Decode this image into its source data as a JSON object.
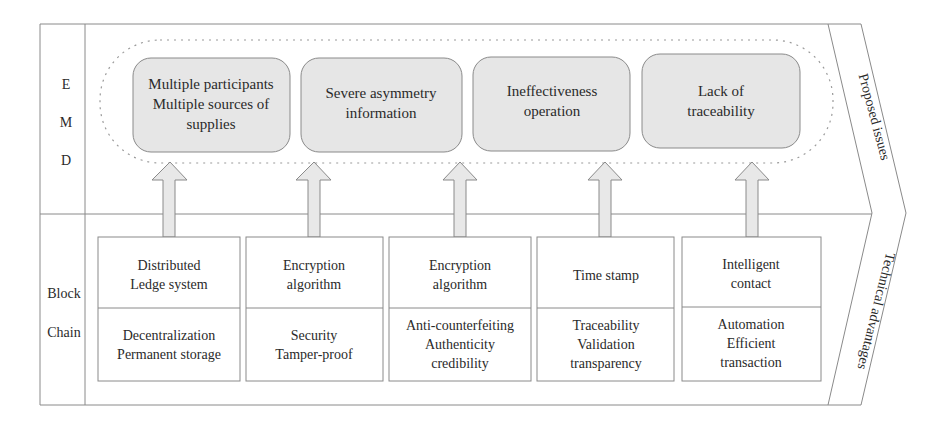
{
  "diagram": {
    "row_labels": {
      "top": [
        "E",
        "M",
        "D"
      ],
      "bottom": [
        "Block",
        "Chain"
      ]
    },
    "band_labels": {
      "top": "Proposed issues",
      "bottom": "Technical advantages"
    },
    "issues": [
      {
        "lines": [
          "Multiple participants",
          "Multiple sources of",
          "supplies"
        ]
      },
      {
        "lines": [
          "Severe asymmetry",
          "information"
        ]
      },
      {
        "lines": [
          "Ineffectiveness",
          "operation"
        ]
      },
      {
        "lines": [
          "Lack of",
          "traceability"
        ]
      }
    ],
    "technologies": [
      {
        "name": [
          "Distributed",
          "Ledge system"
        ],
        "advantages": [
          "Decentralization",
          "Permanent storage"
        ]
      },
      {
        "name": [
          "Encryption",
          "algorithm"
        ],
        "advantages": [
          "Security",
          "Tamper-proof"
        ]
      },
      {
        "name": [
          "Encryption",
          "algorithm"
        ],
        "advantages": [
          "Anti-counterfeiting",
          "Authenticity",
          "credibility"
        ]
      },
      {
        "name": [
          "Time stamp"
        ],
        "advantages": [
          "Traceability",
          "Validation",
          "transparency"
        ]
      },
      {
        "name": [
          "Intelligent",
          "contact"
        ],
        "advantages": [
          "Automation",
          "Efficient",
          "transaction"
        ]
      }
    ],
    "colors": {
      "line": "#8a8a8a",
      "issue_fill": "#e6e6e6",
      "arrow_fill": "#e8e8e8",
      "text": "#2a2a2a"
    }
  }
}
